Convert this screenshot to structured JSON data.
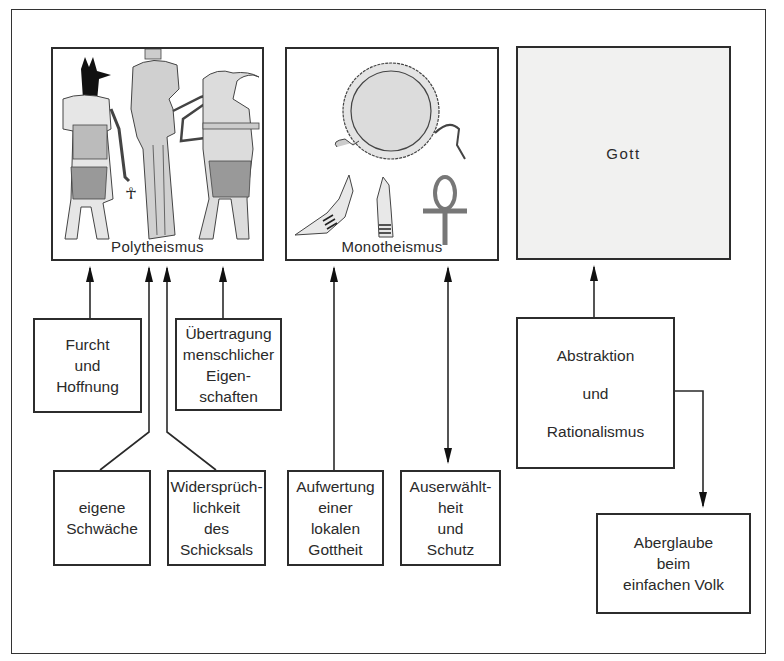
{
  "diagram": {
    "type": "flow-diagram",
    "top_nodes": [
      {
        "id": "polytheismus",
        "label": "Polytheismus",
        "illustration": "egyptian-gods-anubis-isis-thoth"
      },
      {
        "id": "monotheismus",
        "label": "Monotheismus",
        "illustration": "sun-disk-uraeus-hands-ankh"
      },
      {
        "id": "gott",
        "label": "Gott"
      }
    ],
    "factor_nodes": [
      {
        "id": "furcht",
        "label": "Furcht\nund\nHoffnung"
      },
      {
        "id": "uebertragung",
        "label": "Übertragung\nmenschlicher\nEigen-\nschaften"
      },
      {
        "id": "schwaeche",
        "label": "eigene\nSchwäche"
      },
      {
        "id": "widerspruch",
        "label": "Widersprüch-\nlichkeit\ndes\nSchicksals"
      },
      {
        "id": "aufwertung",
        "label": "Aufwertung\neiner\nlokalen\nGottheit"
      },
      {
        "id": "auserwaehlt",
        "label": "Auserwählt-\nheit\nund\nSchutz"
      },
      {
        "id": "abstraktion",
        "label": "Abstraktion\n\nund\n\nRationalismus"
      },
      {
        "id": "aberglaube",
        "label": "Aberglaube\nbeim\neinfachen Volk"
      }
    ],
    "edges": [
      {
        "from": "furcht",
        "to": "polytheismus",
        "type": "arrow"
      },
      {
        "from": "schwaeche",
        "to": "polytheismus",
        "type": "arrow"
      },
      {
        "from": "widerspruch",
        "to": "polytheismus",
        "type": "arrow"
      },
      {
        "from": "uebertragung",
        "to": "polytheismus",
        "type": "arrow"
      },
      {
        "from": "aufwertung",
        "to": "monotheismus",
        "type": "arrow"
      },
      {
        "from": "auserwaehlt",
        "to": "monotheismus",
        "type": "double-arrow"
      },
      {
        "from": "abstraktion",
        "to": "gott",
        "type": "arrow"
      },
      {
        "from": "abstraktion",
        "to": "aberglaube",
        "type": "arrow"
      }
    ]
  }
}
